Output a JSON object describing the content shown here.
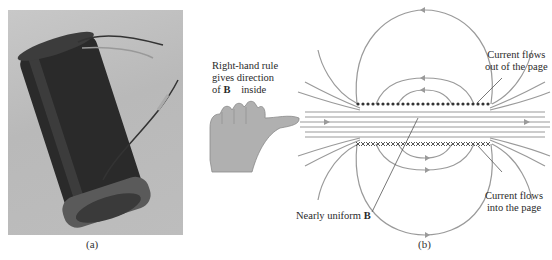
{
  "figure": {
    "panel_a": {
      "caption": "(a)",
      "description": "Photograph of a wire-wound solenoid coil with two lead wires"
    },
    "panel_b": {
      "caption": "(b)",
      "description": "Cross-section of a solenoid showing magnetic field lines",
      "labels": {
        "right_hand_rule_line1": "Right-hand rule",
        "right_hand_rule_line2": "gives direction",
        "right_hand_rule_line3_prefix": "of ",
        "right_hand_rule_symbol": "B⃗",
        "right_hand_rule_line3_suffix": " inside",
        "current_out_line1": "Current flows",
        "current_out_line2": "out of the page",
        "current_in_line1": "Current flows",
        "current_in_line2": "into the page",
        "uniform_prefix": "Nearly uniform ",
        "uniform_symbol": "B⃗"
      },
      "top_row_marker": "dot",
      "bottom_row_marker": "cross",
      "colors": {
        "field_line": "#9a9a9a",
        "conductor": "#333333",
        "hand_fill": "#b0b0b0"
      }
    }
  }
}
